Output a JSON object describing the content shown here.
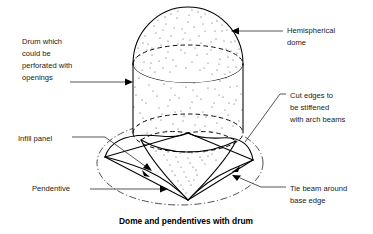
{
  "figure": {
    "caption": "Dome and pendentives with drum",
    "background_color": "#ffffff",
    "ink_color": "#000000",
    "width": 373,
    "height": 234
  },
  "labels": {
    "drum": {
      "lines": [
        "Drum which",
        "could be",
        "perforated with",
        "openings"
      ],
      "position": "top-left",
      "leader": "horizontal arrow pointing right to drum wall"
    },
    "hemispherical_dome": {
      "lines": [
        "Hemispherical",
        "dome"
      ],
      "position": "top-right",
      "leader": "horizontal arrow pointing left to dome surface"
    },
    "cut_edges": {
      "lines": [
        "Cut edges to",
        "be stiffened",
        "with arch beams"
      ],
      "position": "middle-right",
      "leader": "diagonal line down-left to arch edge"
    },
    "tie_beam": {
      "lines": [
        "Tie beam around",
        "base edge"
      ],
      "position": "bottom-right",
      "leader": "horizontal then diagonal arrow to base edge"
    },
    "infill_panel": {
      "lines": [
        "Infill panel"
      ],
      "position": "middle-left",
      "leader": "horizontal then diagonal arrow into panel"
    },
    "pendentive": {
      "lines": [
        "Pendentive"
      ],
      "position": "bottom-left",
      "leader": "horizontal arrow pointing right to pendentive surface"
    }
  },
  "geometry": {
    "dome": {
      "apex_y": 8,
      "left_x": 132,
      "right_x": 244,
      "springing_y": 63
    },
    "drum": {
      "top_y": 63,
      "bottom_y": 133,
      "left_x": 133,
      "right_x": 243
    },
    "tie_beam_square": {
      "left_corner": [
        105,
        157
      ],
      "top_corner": [
        188,
        133
      ],
      "right_corner": [
        253,
        160
      ],
      "front_corner": [
        188,
        200
      ]
    },
    "base_circle": {
      "center": [
        180,
        163
      ],
      "rx": 83,
      "ry": 42
    }
  }
}
